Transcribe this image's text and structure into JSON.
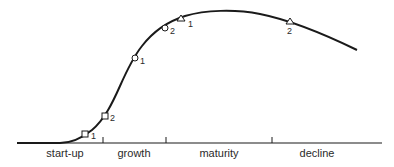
{
  "diagram": {
    "type": "product-life-cycle-curve",
    "stages": [
      {
        "label": "start-up",
        "center_x": 65
      },
      {
        "label": "growth",
        "center_x": 134
      },
      {
        "label": "maturity",
        "center_x": 219
      },
      {
        "label": "decline",
        "center_x": 317
      }
    ],
    "stage_boundaries_x": [
      103,
      166,
      272
    ],
    "markers": [
      {
        "shape": "square",
        "label": "1",
        "x": 85,
        "y": 135
      },
      {
        "shape": "square",
        "label": "2",
        "x": 105,
        "y": 116
      },
      {
        "shape": "circle",
        "label": "1",
        "x": 135,
        "y": 58
      },
      {
        "shape": "circle",
        "label": "2",
        "x": 165,
        "y": 28
      },
      {
        "shape": "triangle",
        "label": "1",
        "x": 181,
        "y": 19
      },
      {
        "shape": "triangle",
        "label": "2",
        "x": 290,
        "y": 22
      }
    ],
    "colors": {
      "line": "#1a1a1a",
      "text": "#2a2a2a",
      "background": "#ffffff"
    }
  }
}
